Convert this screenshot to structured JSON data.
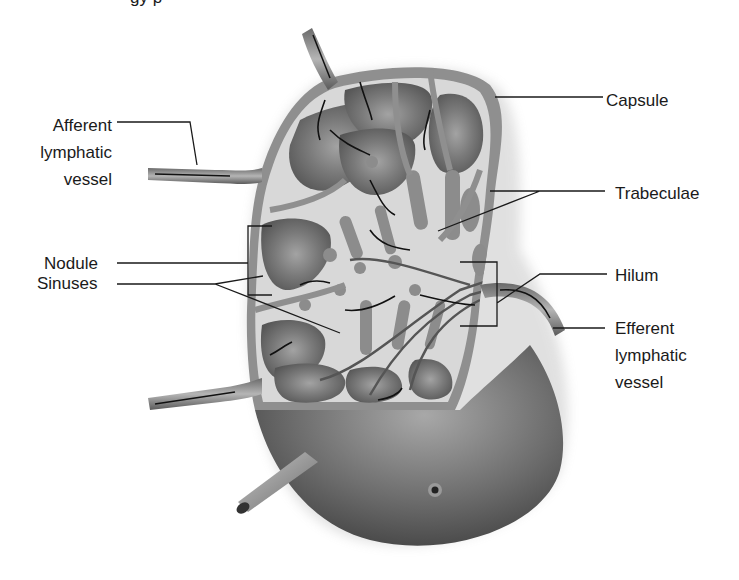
{
  "figure": {
    "title_fragment": "gy p"
  },
  "labels": {
    "capsule": "Capsule",
    "trabeculae": "Trabeculae",
    "afferent": [
      "Afferent",
      "lymphatic",
      "vessel"
    ],
    "nodule": "Nodule",
    "sinuses": "Sinuses",
    "hilum": "Hilum",
    "efferent": [
      "Efferent",
      "lymphatic",
      "vessel"
    ]
  },
  "colors": {
    "capsule": "#8a8a8a",
    "sinus": "#d9d9d9",
    "nodule_dark": "#5c5c5c",
    "nodule_light": "#9a9a9a",
    "exterior_body": "#6e6e6e",
    "leader_line": "#1a1a1a",
    "text": "#1a1a1a"
  }
}
